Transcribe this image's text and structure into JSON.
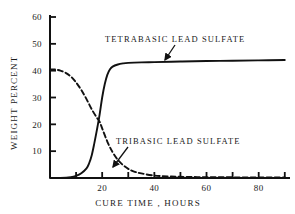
{
  "chart_data": {
    "type": "line",
    "title": "",
    "xlabel": "CURE  TIME ,   HOURS",
    "ylabel": "WEIGHT  PERCENT",
    "xlim": [
      0,
      92
    ],
    "ylim": [
      0,
      60
    ],
    "grid": false,
    "legend_position": "inline-annotations",
    "x_ticks": [
      10,
      20,
      30,
      40,
      50,
      60,
      70,
      80,
      90
    ],
    "x_tick_labels": [
      "",
      "20",
      "",
      "40",
      "",
      "60",
      "",
      "80",
      ""
    ],
    "x_major_labels": [
      "20",
      "40",
      "60",
      "80"
    ],
    "y_ticks": [
      10,
      20,
      30,
      40,
      50,
      60
    ],
    "y_tick_labels": [
      "10",
      "20",
      "30",
      "40",
      "50",
      "60"
    ],
    "series": [
      {
        "name": "TETRABASIC  LEAD  SULFATE",
        "style": "solid",
        "color": "#111111",
        "x": [
          0,
          4,
          8,
          10,
          12,
          14,
          15,
          16,
          17,
          18,
          19,
          20,
          21,
          22,
          23,
          24,
          26,
          28,
          30,
          35,
          40,
          50,
          60,
          70,
          80,
          90
        ],
        "values": [
          0,
          0,
          0.3,
          0.8,
          1.8,
          3.6,
          5.5,
          8.5,
          13,
          18,
          23.5,
          30,
          35,
          38.5,
          40.5,
          41.5,
          42.3,
          42.7,
          42.9,
          43.1,
          43.2,
          43.4,
          43.6,
          43.7,
          43.85,
          44
        ]
      },
      {
        "name": "TRIBASIC  LEAD  SULFATE",
        "style": "dashed",
        "color": "#111111",
        "x": [
          0,
          2,
          4,
          6,
          8,
          10,
          12,
          14,
          16,
          18,
          19,
          20,
          22,
          24,
          26,
          28,
          30,
          32,
          35,
          40,
          45,
          50,
          60,
          70,
          80,
          90
        ],
        "values": [
          40.5,
          40.4,
          40,
          39.2,
          37.8,
          35.6,
          32.8,
          29.4,
          25.6,
          22.4,
          21,
          18.5,
          13.5,
          9.6,
          6.8,
          4.8,
          3.4,
          2.5,
          1.7,
          0.9,
          0.6,
          0.45,
          0.3,
          0.25,
          0.2,
          0.2
        ]
      }
    ],
    "annotations": [
      {
        "name": "tetrabasic-annotation",
        "text": "TETRABASIC  LEAD  SULFATE",
        "text_x": 105,
        "text_y": 42,
        "leader_from_x": 175,
        "leader_from_y": 45,
        "leader_to_x": 165,
        "leader_to_y": 60
      },
      {
        "name": "tribasic-annotation",
        "text": "TRIBASIC  LEAD  SULFATE",
        "text_x": 116,
        "text_y": 144,
        "leader_from_x": 128,
        "leader_from_y": 147,
        "leader_to_x": 113,
        "leader_to_y": 167
      }
    ]
  }
}
